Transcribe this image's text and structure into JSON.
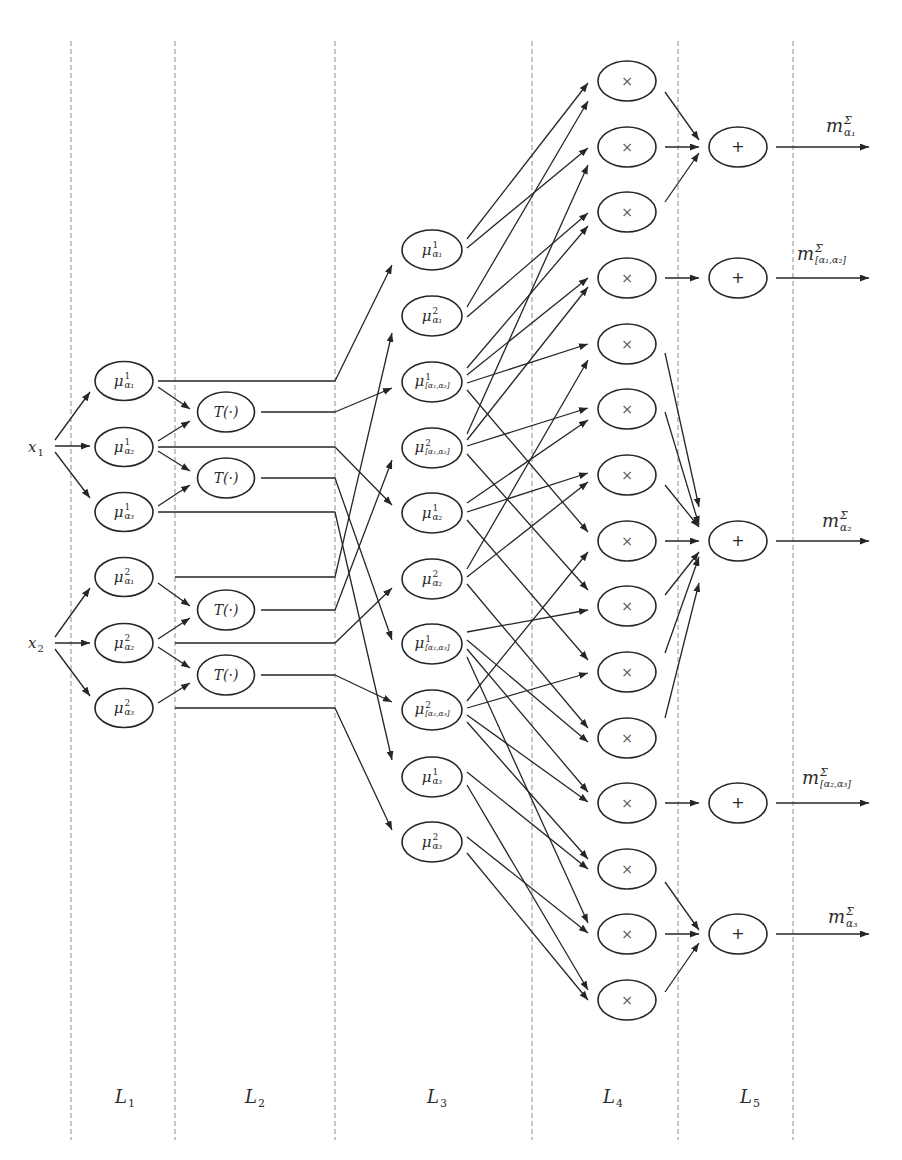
{
  "figure": {
    "colors": {
      "stroke": "#262626",
      "divider": "#8c8c8c",
      "text": "#2b2b2b",
      "op_text": "#5a5a5a",
      "background": "#ffffff"
    },
    "dividers": {
      "x": [
        71,
        175,
        335,
        532,
        678,
        793
      ],
      "y_top": 41,
      "y_bottom": 1140
    },
    "layer_labels": [
      {
        "base": "L",
        "sub": "1",
        "x": 125,
        "y": 1097
      },
      {
        "base": "L",
        "sub": "2",
        "x": 255,
        "y": 1097
      },
      {
        "base": "L",
        "sub": "3",
        "x": 437,
        "y": 1097
      },
      {
        "base": "L",
        "sub": "4",
        "x": 613,
        "y": 1097
      },
      {
        "base": "L",
        "sub": "5",
        "x": 750,
        "y": 1097
      }
    ],
    "inputs": [
      {
        "id": "x1",
        "base": "x",
        "sub": "1",
        "x": 36,
        "y": 447
      },
      {
        "id": "x2",
        "base": "x",
        "sub": "2",
        "x": 36,
        "y": 643
      }
    ],
    "layers": [
      {
        "name": "L1",
        "kind": "fuzzy",
        "x": 124,
        "rx": 29,
        "ry": 19.5,
        "nodes": [
          {
            "id": "mu1-a1",
            "y": 381,
            "base": "μ",
            "sup": "1",
            "sub": "α₁"
          },
          {
            "id": "mu1-a2",
            "y": 447,
            "base": "μ",
            "sup": "1",
            "sub": "α₂"
          },
          {
            "id": "mu1-a3",
            "y": 512,
            "base": "μ",
            "sup": "1",
            "sub": "α₃"
          },
          {
            "id": "mu2-a1",
            "y": 577,
            "base": "μ",
            "sup": "2",
            "sub": "α₁"
          },
          {
            "id": "mu2-a2",
            "y": 643,
            "base": "μ",
            "sup": "2",
            "sub": "α₂"
          },
          {
            "id": "mu2-a3",
            "y": 708,
            "base": "μ",
            "sup": "2",
            "sub": "α₃"
          }
        ]
      },
      {
        "name": "L2",
        "kind": "transform",
        "x": 226,
        "rx": 28.5,
        "ry": 20,
        "nodes": [
          {
            "id": "t1",
            "y": 412,
            "text": "T(·)"
          },
          {
            "id": "t2",
            "y": 478,
            "text": "T(·)"
          },
          {
            "id": "t3",
            "y": 610,
            "text": "T(·)"
          },
          {
            "id": "t4",
            "y": 675,
            "text": "T(·)"
          }
        ]
      },
      {
        "name": "L3",
        "kind": "fuzzy",
        "x": 432,
        "rx": 30,
        "ry": 20,
        "nodes": [
          {
            "id": "n0",
            "y": 250,
            "base": "μ",
            "sup": "1",
            "sub": "α₁"
          },
          {
            "id": "n1",
            "y": 316,
            "base": "μ",
            "sup": "2",
            "sub": "α₁"
          },
          {
            "id": "n2",
            "y": 382,
            "base": "μ",
            "sup": "1",
            "sub": "[α₁,α₂]"
          },
          {
            "id": "n3",
            "y": 448,
            "base": "μ",
            "sup": "2",
            "sub": "[α₁,α₂]"
          },
          {
            "id": "n4",
            "y": 513,
            "base": "μ",
            "sup": "1",
            "sub": "α₂"
          },
          {
            "id": "n5",
            "y": 579,
            "base": "μ",
            "sup": "2",
            "sub": "α₂"
          },
          {
            "id": "n6",
            "y": 644,
            "base": "μ",
            "sup": "1",
            "sub": "[α₂,α₃]"
          },
          {
            "id": "n7",
            "y": 710,
            "base": "μ",
            "sup": "2",
            "sub": "[α₂,α₃]"
          },
          {
            "id": "n8",
            "y": 777,
            "base": "μ",
            "sup": "1",
            "sub": "α₃"
          },
          {
            "id": "n9",
            "y": 842,
            "base": "μ",
            "sup": "2",
            "sub": "α₃"
          }
        ]
      },
      {
        "name": "L4",
        "kind": "product",
        "x": 627,
        "rx": 29,
        "ry": 20,
        "nodes": [
          {
            "id": "p0",
            "y": 81,
            "text": "×"
          },
          {
            "id": "p1",
            "y": 147,
            "text": "×"
          },
          {
            "id": "p2",
            "y": 212,
            "text": "×"
          },
          {
            "id": "p3",
            "y": 278,
            "text": "×"
          },
          {
            "id": "p4",
            "y": 344,
            "text": "×"
          },
          {
            "id": "p5",
            "y": 409,
            "text": "×"
          },
          {
            "id": "p6",
            "y": 475,
            "text": "×"
          },
          {
            "id": "p7",
            "y": 541,
            "text": "×"
          },
          {
            "id": "p8",
            "y": 606,
            "text": "×"
          },
          {
            "id": "p9",
            "y": 672,
            "text": "×"
          },
          {
            "id": "p10",
            "y": 738,
            "text": "×"
          },
          {
            "id": "p11",
            "y": 803,
            "text": "×"
          },
          {
            "id": "p12",
            "y": 869,
            "text": "×"
          },
          {
            "id": "p13",
            "y": 934,
            "text": "×"
          },
          {
            "id": "p14",
            "y": 1000,
            "text": "×"
          }
        ]
      },
      {
        "name": "L5",
        "kind": "sum",
        "x": 738,
        "rx": 29,
        "ry": 20,
        "nodes": [
          {
            "id": "q0",
            "y": 147,
            "text": "+"
          },
          {
            "id": "q1",
            "y": 278,
            "text": "+"
          },
          {
            "id": "q2",
            "y": 541,
            "text": "+"
          },
          {
            "id": "q3",
            "y": 803,
            "text": "+"
          },
          {
            "id": "q4",
            "y": 934,
            "text": "+"
          }
        ]
      }
    ],
    "outputs": [
      {
        "id": "o0",
        "x": 869,
        "y": 147,
        "label": {
          "base": "m",
          "sup": "Σ",
          "sub": "α₁"
        },
        "label_x": 826,
        "label_y": 126
      },
      {
        "id": "o1",
        "x": 869,
        "y": 278,
        "label": {
          "base": "m",
          "sup": "Σ",
          "sub": "[α₁,α₂]"
        },
        "label_x": 797,
        "label_y": 254
      },
      {
        "id": "o2",
        "x": 869,
        "y": 541,
        "label": {
          "base": "m",
          "sup": "Σ",
          "sub": "α₂"
        },
        "label_x": 822,
        "label_y": 521
      },
      {
        "id": "o3",
        "x": 869,
        "y": 803,
        "label": {
          "base": "m",
          "sup": "Σ",
          "sub": "[α₂,α₃]"
        },
        "label_x": 802,
        "label_y": 778
      },
      {
        "id": "o4",
        "x": 869,
        "y": 934,
        "label": {
          "base": "m",
          "sup": "Σ",
          "sub": "α₃"
        },
        "label_x": 828,
        "label_y": 917
      }
    ],
    "edge_groups": [
      {
        "name": "inputs-to-L1",
        "src_gap": 19,
        "dst_gap": 5,
        "items": [
          {
            "from": "x1",
            "to": "mu1-a1",
            "sy": -7,
            "ty": 11
          },
          {
            "from": "x1",
            "to": "mu1-a2",
            "sy": -1,
            "ty": -1
          },
          {
            "from": "x1",
            "to": "mu1-a3",
            "sy": 5,
            "ty": -14
          },
          {
            "from": "x2",
            "to": "mu2-a1",
            "sy": -6,
            "ty": 11
          },
          {
            "from": "x2",
            "to": "mu2-a2",
            "sy": 0,
            "ty": 0
          },
          {
            "from": "x2",
            "to": "mu2-a3",
            "sy": 6,
            "ty": -12
          }
        ]
      },
      {
        "name": "L1-to-L2",
        "src_gap": 5,
        "dst_gap": 7.5,
        "items": [
          {
            "from": "mu1-a1",
            "to": "t1",
            "sy": 6,
            "ty": -3
          },
          {
            "from": "mu1-a2",
            "to": "t1",
            "sy": -6,
            "ty": 9
          },
          {
            "from": "mu1-a2",
            "to": "t2",
            "sy": 4,
            "ty": -7
          },
          {
            "from": "mu1-a3",
            "to": "t2",
            "sy": -6,
            "ty": 7
          },
          {
            "from": "mu2-a1",
            "to": "t3",
            "sy": 6,
            "ty": -4
          },
          {
            "from": "mu2-a2",
            "to": "t3",
            "sy": -4,
            "ty": 8
          },
          {
            "from": "mu2-a2",
            "to": "t4",
            "sy": 4,
            "ty": -7
          },
          {
            "from": "mu2-a3",
            "to": "t4",
            "sy": -5,
            "ty": 8
          }
        ]
      },
      {
        "name": "L1L2-to-L3",
        "bend": 335,
        "dst_gap": 10,
        "items": [
          {
            "from": "mu1-a1",
            "to": "n0",
            "sx": 158,
            "ty": 15
          },
          {
            "from": "t1",
            "to": "n2",
            "sx": 261,
            "ty": 6
          },
          {
            "from": "mu1-a2",
            "to": "n4",
            "sx": 158,
            "ty": -8
          },
          {
            "from": "t2",
            "to": "n6",
            "sx": 261,
            "ty": -4
          },
          {
            "from": "mu1-a3",
            "to": "n8",
            "sx": 158,
            "ty": -17
          },
          {
            "from": "mu2-a1",
            "to": "n1",
            "sx": 175,
            "ty": 17
          },
          {
            "from": "t3",
            "to": "n3",
            "sx": 261,
            "ty": 12
          },
          {
            "from": "mu2-a2",
            "to": "n5",
            "sx": 175,
            "ty": 9
          },
          {
            "from": "t4",
            "to": "n7",
            "sx": 261,
            "ty": -8
          },
          {
            "from": "mu2-a3",
            "to": "n9",
            "sx": 175,
            "ty": -12
          }
        ]
      },
      {
        "name": "L3-to-L4",
        "src_gap": 5,
        "dst_gap": 10,
        "items": [
          {
            "from": "n0",
            "to": "p0",
            "sy": -11,
            "ty": 2
          },
          {
            "from": "n1",
            "to": "p0",
            "sy": -9,
            "ty": 20
          },
          {
            "from": "n0",
            "to": "p1",
            "sy": -2,
            "ty": 1
          },
          {
            "from": "n3",
            "to": "p1",
            "sy": -14,
            "ty": 18
          },
          {
            "from": "n1",
            "to": "p2",
            "sy": 1,
            "ty": 1
          },
          {
            "from": "n2",
            "to": "p2",
            "sy": -14,
            "ty": 14
          },
          {
            "from": "n2",
            "to": "p3",
            "sy": -7,
            "ty": 0
          },
          {
            "from": "n3",
            "to": "p3",
            "sy": -8,
            "ty": 9
          },
          {
            "from": "n2",
            "to": "p4",
            "sy": 1,
            "ty": 0
          },
          {
            "from": "n5",
            "to": "p4",
            "sy": -10,
            "ty": 16
          },
          {
            "from": "n3",
            "to": "p5",
            "sy": -2,
            "ty": -1
          },
          {
            "from": "n4",
            "to": "p5",
            "sy": -10,
            "ty": 11
          },
          {
            "from": "n4",
            "to": "p6",
            "sy": -1,
            "ty": -2
          },
          {
            "from": "n5",
            "to": "p6",
            "sy": -2,
            "ty": 7
          },
          {
            "from": "n2",
            "to": "p7",
            "sy": 8,
            "ty": -9
          },
          {
            "from": "n7",
            "to": "p7",
            "sy": -9,
            "ty": 11
          },
          {
            "from": "n3",
            "to": "p8",
            "sy": 6,
            "ty": -16
          },
          {
            "from": "n6",
            "to": "p8",
            "sy": -12,
            "ty": 4
          },
          {
            "from": "n4",
            "to": "p9",
            "sy": 7,
            "ty": -12
          },
          {
            "from": "n7",
            "to": "p9",
            "sy": -2,
            "ty": 1
          },
          {
            "from": "n5",
            "to": "p10",
            "sy": 5,
            "ty": -10
          },
          {
            "from": "n6",
            "to": "p10",
            "sy": -4,
            "ty": 4
          },
          {
            "from": "n6",
            "to": "p11",
            "sy": 5,
            "ty": -11
          },
          {
            "from": "n7",
            "to": "p11",
            "sy": 5,
            "ty": -1
          },
          {
            "from": "n7",
            "to": "p12",
            "sy": 12,
            "ty": -10
          },
          {
            "from": "n8",
            "to": "p12",
            "sy": -5,
            "ty": 0
          },
          {
            "from": "n6",
            "to": "p13",
            "sy": 13,
            "ty": -11
          },
          {
            "from": "n9",
            "to": "p13",
            "sy": -5,
            "ty": -1
          },
          {
            "from": "n8",
            "to": "p14",
            "sy": 8,
            "ty": -10
          },
          {
            "from": "n9",
            "to": "p14",
            "sy": 11,
            "ty": 0
          }
        ]
      },
      {
        "name": "L4-to-L5",
        "src_gap": 9,
        "dst_gap": 10,
        "items": [
          {
            "from": "p0",
            "to": "q0",
            "sy": 11,
            "ty": -7
          },
          {
            "from": "p1",
            "to": "q0",
            "sy": 0,
            "ty": 0
          },
          {
            "from": "p2",
            "to": "q0",
            "sy": -10,
            "ty": 6
          },
          {
            "from": "p3",
            "to": "q1",
            "sy": 0,
            "ty": 0
          },
          {
            "from": "p4",
            "to": "q2",
            "sy": 9,
            "ty": -34
          },
          {
            "from": "p5",
            "to": "q2",
            "sy": 3,
            "ty": -16
          },
          {
            "from": "p6",
            "to": "q2",
            "sy": 10,
            "ty": -14
          },
          {
            "from": "p7",
            "to": "q2",
            "sy": 0,
            "ty": 0
          },
          {
            "from": "p8",
            "to": "q2",
            "sy": -11,
            "ty": 11
          },
          {
            "from": "p9",
            "to": "q2",
            "sy": -19,
            "ty": 16
          },
          {
            "from": "p10",
            "to": "q2",
            "sy": -20,
            "ty": 42
          },
          {
            "from": "p11",
            "to": "q3",
            "sy": 0,
            "ty": 0
          },
          {
            "from": "p12",
            "to": "q4",
            "sy": 13,
            "ty": -4
          },
          {
            "from": "p13",
            "to": "q4",
            "sy": 0,
            "ty": 0
          },
          {
            "from": "p14",
            "to": "q4",
            "sy": -8,
            "ty": 9
          }
        ]
      },
      {
        "name": "L5-to-outputs",
        "src_gap": 9,
        "dst_gap": 0,
        "items": [
          {
            "from": "q0",
            "to": "o0",
            "sy": 0,
            "ty": 0
          },
          {
            "from": "q1",
            "to": "o1",
            "sy": 0,
            "ty": 0
          },
          {
            "from": "q2",
            "to": "o2",
            "sy": 0,
            "ty": 0
          },
          {
            "from": "q3",
            "to": "o3",
            "sy": 0,
            "ty": 0
          },
          {
            "from": "q4",
            "to": "o4",
            "sy": 0,
            "ty": 0
          }
        ]
      }
    ]
  }
}
